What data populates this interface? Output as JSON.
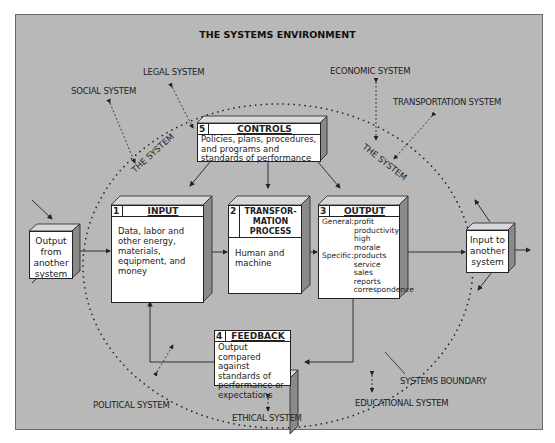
{
  "title": "THE SYSTEMS ENVIRONMENT",
  "environment_labels": {
    "legal": "LEGAL SYSTEM",
    "social": "SOCIAL SYSTEM",
    "economic": "ECONOMIC SYSTEM",
    "transportation": "TRANSPORTATION SYSTEM",
    "political": "POLITICAL SYSTEM",
    "ethical": "ETHICAL SYSTEM",
    "educational": "EDUCATIONAL SYSTEM",
    "boundary": "SYSTEMS BOUNDARY"
  },
  "system_label": "THE SYSTEM",
  "boxes": {
    "controls": {
      "num": "5",
      "title": "CONTROLS",
      "text": "Policies, plans, procedures, and programs and standards of performance"
    },
    "input": {
      "num": "1",
      "title": "INPUT",
      "text": "Data, labor and other energy, materials, equipment, and money"
    },
    "transformation": {
      "num": "2",
      "title": "TRANSFOR-MATION PROCESS",
      "text": "Human and machine"
    },
    "output": {
      "num": "3",
      "title": "OUTPUT",
      "general_label": "General:",
      "general": [
        "profit",
        "productivity",
        "high morale"
      ],
      "specific_label": "Specific:",
      "specific": [
        "products",
        "service",
        "sales",
        "reports",
        "correspondence"
      ]
    },
    "feedback": {
      "num": "4",
      "title": "FEEDBACK",
      "text": "Output compared against standards of performance or expectations"
    }
  },
  "external": {
    "left": "Output from another system",
    "right": "Input to another system"
  },
  "colors": {
    "background": "#b8b8b8",
    "box": "#ffffff",
    "box_side": "#8a8a8a",
    "box_top": "#d8d8d8",
    "line": "#222222"
  }
}
